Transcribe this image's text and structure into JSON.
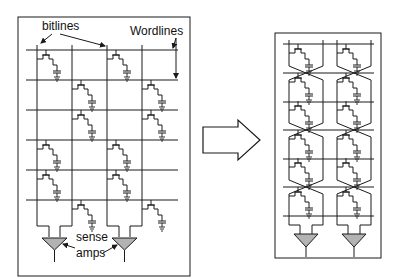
{
  "left_panel": {
    "title": "Open bitline DRAM array",
    "labels": {
      "bitlines": "bitlines",
      "wordlines": "Wordlines",
      "sense_line1": "sense",
      "sense_line2": "amps"
    },
    "wordline_count": 6,
    "bitline_pairs": 2
  },
  "arrow": {
    "direction": "right",
    "icon": "hollow-block-arrow"
  },
  "right_panel": {
    "title": "Folded bitline DRAM array",
    "wordline_count": 8,
    "columns": 2
  },
  "colors": {
    "stroke": "#1a1a1a",
    "sense_amp_fill": "#b3b3b3",
    "background": "#ffffff"
  }
}
